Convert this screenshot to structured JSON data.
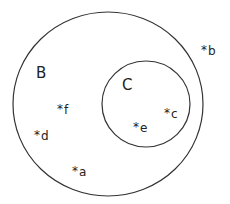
{
  "diagram": {
    "type": "venn",
    "sets": [
      {
        "id": "B",
        "label": "B",
        "contains": [
          "C"
        ]
      },
      {
        "id": "C",
        "label": "C",
        "parent": "B"
      }
    ],
    "elements": [
      {
        "label": "a",
        "marker": "*",
        "in": [
          "B"
        ]
      },
      {
        "label": "b",
        "marker": "*",
        "in": []
      },
      {
        "label": "c",
        "marker": "*",
        "in": [
          "B",
          "C"
        ]
      },
      {
        "label": "d",
        "marker": "*",
        "in": [
          "B"
        ]
      },
      {
        "label": "e",
        "marker": "*",
        "in": [
          "B",
          "C"
        ]
      },
      {
        "label": "f",
        "marker": "*",
        "in": [
          "B"
        ]
      }
    ],
    "colors": {
      "stroke": "#333333",
      "text": "#222222",
      "background": "#ffffff"
    }
  }
}
